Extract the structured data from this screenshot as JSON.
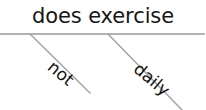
{
  "diagram": {
    "type": "decision-tree-node",
    "node": {
      "label": "does exercise"
    },
    "branches": [
      {
        "id": "left",
        "label": "not"
      },
      {
        "id": "right",
        "label": "daily"
      }
    ],
    "colors": {
      "background": "#ffffff",
      "text": "#161616",
      "branch_text": "#111111",
      "rule": "#9a9a9a",
      "edge": "#a5a5a5"
    },
    "geometry": {
      "width": 206,
      "height": 110,
      "rule_y": 34,
      "rule_x_start": 0,
      "rule_x_end": 204,
      "edge_left": {
        "x1": 30,
        "y1": 34,
        "x2": 90,
        "y2": 93
      },
      "edge_right": {
        "x1": 108,
        "y1": 34,
        "x2": 182,
        "y2": 110
      },
      "branch_rotation_deg": 40
    }
  }
}
